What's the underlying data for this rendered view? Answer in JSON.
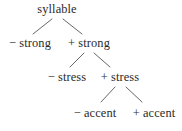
{
  "diagram": {
    "type": "tree",
    "background_color": "#ffffff",
    "text_color": "#2b2b2b",
    "edge_color": "#555555",
    "nodes": [
      {
        "id": "root",
        "sign": "",
        "label": "syllable",
        "text": "syllable",
        "level": 0,
        "cx": 57,
        "cy": 10
      },
      {
        "id": "minus_strong",
        "sign": "−",
        "label": "strong",
        "text": "− strong",
        "level": 1,
        "cx": 30,
        "cy": 44
      },
      {
        "id": "plus_strong",
        "sign": "+",
        "label": "strong",
        "text": "+ strong",
        "level": 1,
        "cx": 89,
        "cy": 44
      },
      {
        "id": "minus_stress",
        "sign": "−",
        "label": "stress",
        "text": "− stress",
        "level": 2,
        "cx": 67,
        "cy": 78
      },
      {
        "id": "plus_stress",
        "sign": "+",
        "label": "stress",
        "text": "+ stress",
        "level": 2,
        "cx": 120,
        "cy": 78
      },
      {
        "id": "minus_accent",
        "sign": "−",
        "label": "accent",
        "text": "− accent",
        "level": 3,
        "cx": 95,
        "cy": 114
      },
      {
        "id": "plus_accent",
        "sign": "+",
        "label": "accent",
        "text": "+ accent",
        "level": 3,
        "cx": 154,
        "cy": 114
      }
    ],
    "edges": [
      {
        "from": "root",
        "to": "minus_strong",
        "x1": 52,
        "y1": 19,
        "x2": 33,
        "y2": 34
      },
      {
        "from": "root",
        "to": "plus_strong",
        "x1": 63,
        "y1": 19,
        "x2": 82,
        "y2": 34
      },
      {
        "from": "plus_strong",
        "to": "minus_stress",
        "x1": 84,
        "y1": 53,
        "x2": 70,
        "y2": 67
      },
      {
        "from": "plus_strong",
        "to": "plus_stress",
        "x1": 94,
        "y1": 53,
        "x2": 110,
        "y2": 67
      },
      {
        "from": "plus_stress",
        "to": "minus_accent",
        "x1": 115,
        "y1": 87,
        "x2": 101,
        "y2": 102
      },
      {
        "from": "plus_stress",
        "to": "plus_accent",
        "x1": 126,
        "y1": 87,
        "x2": 142,
        "y2": 102
      }
    ]
  }
}
